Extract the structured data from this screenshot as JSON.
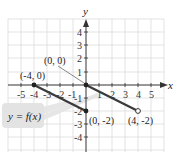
{
  "figure": {
    "axes": {
      "x_label": "x",
      "y_label": "y",
      "x_ticks": [
        "-5",
        "-4",
        "-3",
        "-2",
        "-1",
        "1",
        "2",
        "3",
        "4",
        "5"
      ],
      "y_ticks": [
        "4",
        "3",
        "2",
        "1",
        "-1",
        "-2",
        "-3",
        "-4"
      ],
      "x_range": [
        -6,
        6
      ],
      "y_range": [
        -5,
        5
      ],
      "grid": true
    },
    "function_label": "y = f(x)",
    "segments": [
      {
        "from": [
          -4,
          0
        ],
        "to": [
          0,
          -2
        ],
        "from_closed": true,
        "to_closed": true
      },
      {
        "from": [
          0,
          0
        ],
        "to": [
          4,
          -2
        ],
        "from_closed": true,
        "to_closed": false
      }
    ],
    "point_labels": [
      {
        "text": "(-4, 0)",
        "point": [
          -4,
          0
        ]
      },
      {
        "text": "(0, 0)",
        "point": [
          0,
          0
        ]
      },
      {
        "text": "(0, -2)",
        "point": [
          0,
          -2
        ]
      },
      {
        "text": "(4, -2)",
        "point": [
          4,
          -2
        ]
      }
    ],
    "colors": {
      "grid": "#d9d9d9",
      "axis": "#333333",
      "line": "#3a3a3a",
      "label_box": "#e3e3e3"
    }
  }
}
